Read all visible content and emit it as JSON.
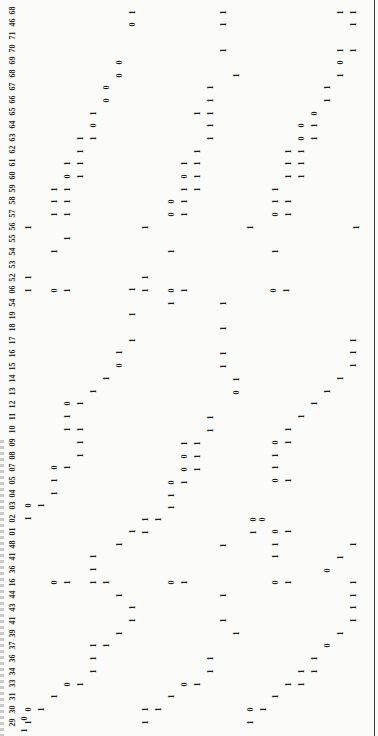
{
  "document": {
    "orientation": "rotated-90-ccw",
    "header_labels": [
      "29",
      "30",
      "31",
      "33",
      "34",
      "36",
      "37",
      "39",
      "41",
      "43",
      "44",
      "16",
      "36",
      "41",
      "48",
      "01",
      "02",
      "03",
      "04",
      "05",
      "07",
      "08",
      "09",
      "10",
      "11",
      "12",
      "13",
      "14",
      "15",
      "16",
      "17",
      "18",
      "19",
      "54",
      "06",
      "52",
      "53",
      "54",
      "55",
      "56",
      "57",
      "58",
      "59",
      "60",
      "61",
      "62",
      "63",
      "64",
      "65",
      "66",
      "67",
      "68",
      "69",
      "70",
      "71",
      "46",
      "68"
    ],
    "cells": [
      {
        "x": 24,
        "y": 730,
        "v": "1"
      },
      {
        "x": 24,
        "y": 718,
        "v": "0"
      },
      {
        "x": 28,
        "y": 722,
        "v": "1"
      },
      {
        "x": 28,
        "y": 709,
        "v": "0"
      },
      {
        "x": 41,
        "y": 709,
        "v": "1"
      },
      {
        "x": 54,
        "y": 696,
        "v": "1"
      },
      {
        "x": 67,
        "y": 684,
        "v": "0"
      },
      {
        "x": 80,
        "y": 684,
        "v": "1"
      },
      {
        "x": 93,
        "y": 671,
        "v": "1"
      },
      {
        "x": 93,
        "y": 658,
        "v": "1"
      },
      {
        "x": 93,
        "y": 645,
        "v": "1"
      },
      {
        "x": 106,
        "y": 645,
        "v": "1"
      },
      {
        "x": 119,
        "y": 633,
        "v": "1"
      },
      {
        "x": 132,
        "y": 620,
        "v": "1"
      },
      {
        "x": 132,
        "y": 607,
        "v": "1"
      },
      {
        "x": 119,
        "y": 595,
        "v": "1"
      },
      {
        "x": 106,
        "y": 582,
        "v": "1"
      },
      {
        "x": 93,
        "y": 582,
        "v": "1"
      },
      {
        "x": 93,
        "y": 569,
        "v": "1"
      },
      {
        "x": 93,
        "y": 556,
        "v": "1"
      },
      {
        "x": 54,
        "y": 582,
        "v": "0"
      },
      {
        "x": 67,
        "y": 582,
        "v": "1"
      },
      {
        "x": 119,
        "y": 544,
        "v": "1"
      },
      {
        "x": 132,
        "y": 531,
        "v": "1"
      },
      {
        "x": 28,
        "y": 518,
        "v": "1"
      },
      {
        "x": 28,
        "y": 505,
        "v": "0"
      },
      {
        "x": 41,
        "y": 505,
        "v": "1"
      },
      {
        "x": 54,
        "y": 493,
        "v": "1"
      },
      {
        "x": 54,
        "y": 480,
        "v": "1"
      },
      {
        "x": 54,
        "y": 467,
        "v": "0"
      },
      {
        "x": 67,
        "y": 467,
        "v": "1"
      },
      {
        "x": 80,
        "y": 455,
        "v": "1"
      },
      {
        "x": 80,
        "y": 442,
        "v": "1"
      },
      {
        "x": 80,
        "y": 429,
        "v": "1"
      },
      {
        "x": 67,
        "y": 429,
        "v": "1"
      },
      {
        "x": 67,
        "y": 416,
        "v": "1"
      },
      {
        "x": 67,
        "y": 403,
        "v": "0"
      },
      {
        "x": 80,
        "y": 403,
        "v": "1"
      },
      {
        "x": 93,
        "y": 391,
        "v": "1"
      },
      {
        "x": 106,
        "y": 378,
        "v": "1"
      },
      {
        "x": 119,
        "y": 365,
        "v": "0"
      },
      {
        "x": 119,
        "y": 352,
        "v": "1"
      },
      {
        "x": 132,
        "y": 340,
        "v": "1"
      },
      {
        "x": 132,
        "y": 314,
        "v": "1"
      },
      {
        "x": 132,
        "y": 289,
        "v": "1"
      },
      {
        "x": 28,
        "y": 290,
        "v": "1"
      },
      {
        "x": 28,
        "y": 277,
        "v": "1"
      },
      {
        "x": 54,
        "y": 290,
        "v": "0"
      },
      {
        "x": 67,
        "y": 290,
        "v": "1"
      },
      {
        "x": 54,
        "y": 251,
        "v": "1"
      },
      {
        "x": 67,
        "y": 238,
        "v": "1"
      },
      {
        "x": 28,
        "y": 227,
        "v": "1"
      },
      {
        "x": 54,
        "y": 214,
        "v": "1"
      },
      {
        "x": 67,
        "y": 214,
        "v": "1"
      },
      {
        "x": 54,
        "y": 201,
        "v": "1"
      },
      {
        "x": 67,
        "y": 201,
        "v": "1"
      },
      {
        "x": 54,
        "y": 189,
        "v": "1"
      },
      {
        "x": 67,
        "y": 189,
        "v": "1"
      },
      {
        "x": 67,
        "y": 176,
        "v": "0"
      },
      {
        "x": 80,
        "y": 176,
        "v": "1"
      },
      {
        "x": 67,
        "y": 163,
        "v": "1"
      },
      {
        "x": 80,
        "y": 163,
        "v": "1"
      },
      {
        "x": 80,
        "y": 151,
        "v": "1"
      },
      {
        "x": 80,
        "y": 138,
        "v": "1"
      },
      {
        "x": 93,
        "y": 138,
        "v": "1"
      },
      {
        "x": 93,
        "y": 125,
        "v": "0"
      },
      {
        "x": 93,
        "y": 113,
        "v": "1"
      },
      {
        "x": 106,
        "y": 100,
        "v": "0"
      },
      {
        "x": 106,
        "y": 87,
        "v": "0"
      },
      {
        "x": 119,
        "y": 75,
        "v": "0"
      },
      {
        "x": 119,
        "y": 62,
        "v": "0"
      },
      {
        "x": 132,
        "y": 24,
        "v": "0"
      },
      {
        "x": 132,
        "y": 12,
        "v": "1"
      },
      {
        "x": 145,
        "y": 227,
        "v": "1"
      },
      {
        "x": 145,
        "y": 290,
        "v": "1"
      },
      {
        "x": 145,
        "y": 277,
        "v": "1"
      },
      {
        "x": 171,
        "y": 290,
        "v": "0"
      },
      {
        "x": 184,
        "y": 290,
        "v": "1"
      },
      {
        "x": 171,
        "y": 251,
        "v": "1"
      },
      {
        "x": 171,
        "y": 214,
        "v": "0"
      },
      {
        "x": 184,
        "y": 214,
        "v": "1"
      },
      {
        "x": 171,
        "y": 201,
        "v": "0"
      },
      {
        "x": 184,
        "y": 201,
        "v": "1"
      },
      {
        "x": 184,
        "y": 189,
        "v": "1"
      },
      {
        "x": 197,
        "y": 189,
        "v": "1"
      },
      {
        "x": 184,
        "y": 176,
        "v": "0"
      },
      {
        "x": 197,
        "y": 176,
        "v": "1"
      },
      {
        "x": 184,
        "y": 163,
        "v": "1"
      },
      {
        "x": 197,
        "y": 163,
        "v": "1"
      },
      {
        "x": 197,
        "y": 151,
        "v": "1"
      },
      {
        "x": 210,
        "y": 138,
        "v": "1"
      },
      {
        "x": 210,
        "y": 125,
        "v": "1"
      },
      {
        "x": 210,
        "y": 113,
        "v": "1"
      },
      {
        "x": 197,
        "y": 113,
        "v": "1"
      },
      {
        "x": 210,
        "y": 100,
        "v": "1"
      },
      {
        "x": 210,
        "y": 87,
        "v": "1"
      },
      {
        "x": 236,
        "y": 75,
        "v": "1"
      },
      {
        "x": 223,
        "y": 50,
        "v": "1"
      },
      {
        "x": 223,
        "y": 24,
        "v": "1"
      },
      {
        "x": 223,
        "y": 12,
        "v": "1"
      },
      {
        "x": 250,
        "y": 227,
        "v": "1"
      },
      {
        "x": 171,
        "y": 303,
        "v": "1"
      },
      {
        "x": 223,
        "y": 303,
        "v": "1"
      },
      {
        "x": 223,
        "y": 328,
        "v": "1"
      },
      {
        "x": 223,
        "y": 353,
        "v": "1"
      },
      {
        "x": 223,
        "y": 366,
        "v": "1"
      },
      {
        "x": 236,
        "y": 379,
        "v": "1"
      },
      {
        "x": 236,
        "y": 392,
        "v": "0"
      },
      {
        "x": 210,
        "y": 417,
        "v": "1"
      },
      {
        "x": 210,
        "y": 430,
        "v": "1"
      },
      {
        "x": 184,
        "y": 443,
        "v": "1"
      },
      {
        "x": 197,
        "y": 443,
        "v": "1"
      },
      {
        "x": 184,
        "y": 456,
        "v": "0"
      },
      {
        "x": 197,
        "y": 456,
        "v": "1"
      },
      {
        "x": 184,
        "y": 469,
        "v": "0"
      },
      {
        "x": 197,
        "y": 469,
        "v": "1"
      },
      {
        "x": 171,
        "y": 482,
        "v": "0"
      },
      {
        "x": 184,
        "y": 482,
        "v": "1"
      },
      {
        "x": 171,
        "y": 495,
        "v": "1"
      },
      {
        "x": 171,
        "y": 507,
        "v": "1"
      },
      {
        "x": 145,
        "y": 519,
        "v": "1"
      },
      {
        "x": 158,
        "y": 519,
        "v": "1"
      },
      {
        "x": 145,
        "y": 532,
        "v": "1"
      },
      {
        "x": 223,
        "y": 545,
        "v": "1"
      },
      {
        "x": 171,
        "y": 582,
        "v": "0"
      },
      {
        "x": 184,
        "y": 582,
        "v": "1"
      },
      {
        "x": 223,
        "y": 595,
        "v": "1"
      },
      {
        "x": 223,
        "y": 620,
        "v": "1"
      },
      {
        "x": 236,
        "y": 633,
        "v": "1"
      },
      {
        "x": 210,
        "y": 658,
        "v": "1"
      },
      {
        "x": 210,
        "y": 671,
        "v": "1"
      },
      {
        "x": 184,
        "y": 684,
        "v": "0"
      },
      {
        "x": 197,
        "y": 684,
        "v": "1"
      },
      {
        "x": 171,
        "y": 696,
        "v": "1"
      },
      {
        "x": 145,
        "y": 709,
        "v": "1"
      },
      {
        "x": 158,
        "y": 709,
        "v": "1"
      },
      {
        "x": 145,
        "y": 722,
        "v": "1"
      },
      {
        "x": 253,
        "y": 519,
        "v": "0"
      },
      {
        "x": 262,
        "y": 519,
        "v": "0"
      },
      {
        "x": 253,
        "y": 532,
        "v": "1"
      },
      {
        "x": 250,
        "y": 709,
        "v": "0"
      },
      {
        "x": 263,
        "y": 709,
        "v": "1"
      },
      {
        "x": 250,
        "y": 722,
        "v": "1"
      },
      {
        "x": 275,
        "y": 696,
        "v": "1"
      },
      {
        "x": 288,
        "y": 684,
        "v": "1"
      },
      {
        "x": 301,
        "y": 684,
        "v": "1"
      },
      {
        "x": 301,
        "y": 671,
        "v": "1"
      },
      {
        "x": 314,
        "y": 671,
        "v": "1"
      },
      {
        "x": 314,
        "y": 658,
        "v": "1"
      },
      {
        "x": 327,
        "y": 645,
        "v": "0"
      },
      {
        "x": 340,
        "y": 633,
        "v": "1"
      },
      {
        "x": 353,
        "y": 620,
        "v": "1"
      },
      {
        "x": 353,
        "y": 607,
        "v": "1"
      },
      {
        "x": 275,
        "y": 582,
        "v": "0"
      },
      {
        "x": 288,
        "y": 582,
        "v": "1"
      },
      {
        "x": 275,
        "y": 556,
        "v": "1"
      },
      {
        "x": 275,
        "y": 544,
        "v": "1"
      },
      {
        "x": 275,
        "y": 531,
        "v": "0"
      },
      {
        "x": 288,
        "y": 531,
        "v": "1"
      },
      {
        "x": 353,
        "y": 544,
        "v": "1"
      },
      {
        "x": 340,
        "y": 557,
        "v": "1"
      },
      {
        "x": 327,
        "y": 570,
        "v": "0"
      },
      {
        "x": 353,
        "y": 595,
        "v": "1"
      },
      {
        "x": 353,
        "y": 582,
        "v": "1"
      },
      {
        "x": 275,
        "y": 480,
        "v": "0"
      },
      {
        "x": 288,
        "y": 480,
        "v": "1"
      },
      {
        "x": 275,
        "y": 467,
        "v": "1"
      },
      {
        "x": 275,
        "y": 455,
        "v": "1"
      },
      {
        "x": 275,
        "y": 442,
        "v": "0"
      },
      {
        "x": 288,
        "y": 442,
        "v": "1"
      },
      {
        "x": 288,
        "y": 429,
        "v": "1"
      },
      {
        "x": 301,
        "y": 416,
        "v": "1"
      },
      {
        "x": 314,
        "y": 403,
        "v": "1"
      },
      {
        "x": 327,
        "y": 391,
        "v": "1"
      },
      {
        "x": 340,
        "y": 378,
        "v": "1"
      },
      {
        "x": 353,
        "y": 365,
        "v": "1"
      },
      {
        "x": 353,
        "y": 352,
        "v": "1"
      },
      {
        "x": 353,
        "y": 340,
        "v": "1"
      },
      {
        "x": 273,
        "y": 290,
        "v": "0"
      },
      {
        "x": 286,
        "y": 290,
        "v": "1"
      },
      {
        "x": 275,
        "y": 251,
        "v": "1"
      },
      {
        "x": 275,
        "y": 214,
        "v": "0"
      },
      {
        "x": 288,
        "y": 214,
        "v": "1"
      },
      {
        "x": 275,
        "y": 201,
        "v": "1"
      },
      {
        "x": 288,
        "y": 201,
        "v": "1"
      },
      {
        "x": 275,
        "y": 189,
        "v": "1"
      },
      {
        "x": 288,
        "y": 176,
        "v": "1"
      },
      {
        "x": 301,
        "y": 176,
        "v": "1"
      },
      {
        "x": 288,
        "y": 163,
        "v": "1"
      },
      {
        "x": 301,
        "y": 163,
        "v": "1"
      },
      {
        "x": 288,
        "y": 151,
        "v": "1"
      },
      {
        "x": 301,
        "y": 151,
        "v": "1"
      },
      {
        "x": 301,
        "y": 138,
        "v": "0"
      },
      {
        "x": 314,
        "y": 138,
        "v": "1"
      },
      {
        "x": 301,
        "y": 125,
        "v": "0"
      },
      {
        "x": 314,
        "y": 125,
        "v": "1"
      },
      {
        "x": 314,
        "y": 113,
        "v": "0"
      },
      {
        "x": 327,
        "y": 100,
        "v": "1"
      },
      {
        "x": 327,
        "y": 87,
        "v": "1"
      },
      {
        "x": 340,
        "y": 75,
        "v": "1"
      },
      {
        "x": 340,
        "y": 62,
        "v": "0"
      },
      {
        "x": 340,
        "y": 50,
        "v": "1"
      },
      {
        "x": 353,
        "y": 50,
        "v": "1"
      },
      {
        "x": 353,
        "y": 24,
        "v": "1"
      },
      {
        "x": 340,
        "y": 12,
        "v": "1"
      },
      {
        "x": 353,
        "y": 12,
        "v": "1"
      },
      {
        "x": 356,
        "y": 227,
        "v": "1"
      }
    ]
  }
}
